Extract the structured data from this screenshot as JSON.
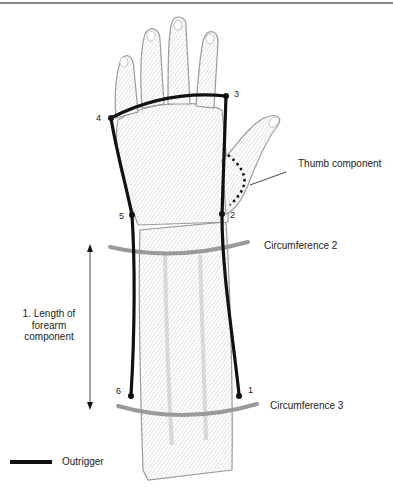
{
  "figure": {
    "type": "anatomical-diagram"
  },
  "labels": {
    "thumb_component": "Thumb component",
    "circumference_2": "Circumference 2",
    "circumference_3": "Circumference 3",
    "length_of_forearm": "1. Length of forearm component"
  },
  "points": [
    {
      "id": "1",
      "label": "1"
    },
    {
      "id": "2",
      "label": "2"
    },
    {
      "id": "3",
      "label": "3"
    },
    {
      "id": "4",
      "label": "4"
    },
    {
      "id": "5",
      "label": "5"
    },
    {
      "id": "6",
      "label": "6"
    }
  ],
  "legend": {
    "items": [
      {
        "symbol": "thick-black-line",
        "label": "Outrigger"
      }
    ]
  },
  "colors": {
    "outrigger": "#111111",
    "circumference": "#9a9a9a",
    "skin_shading": "#bdbdbd",
    "top_rule": "#8a8a8a"
  }
}
